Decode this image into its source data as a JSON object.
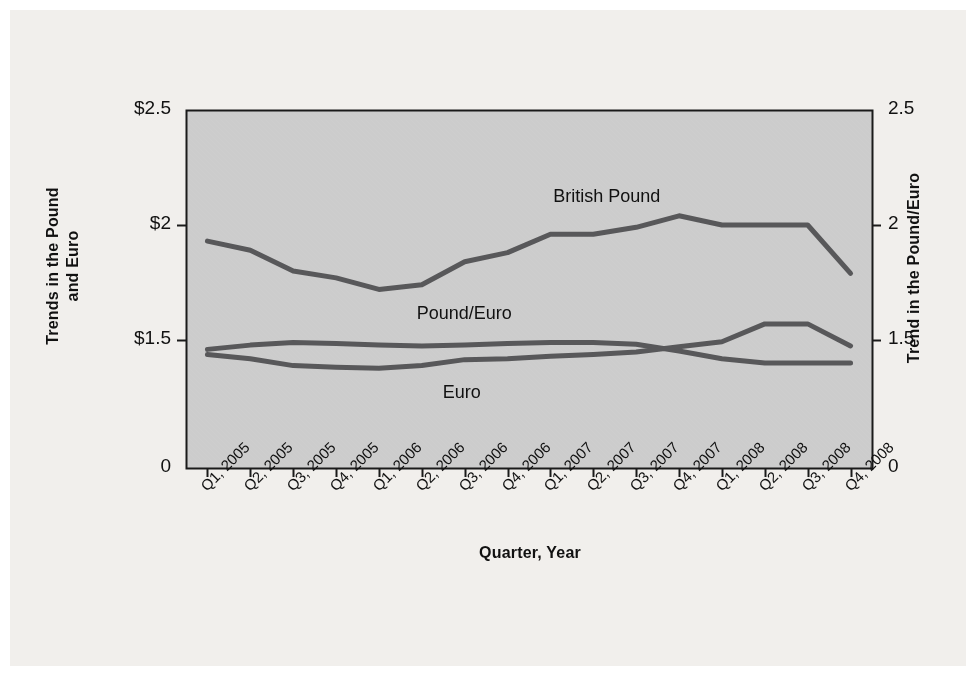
{
  "figure": {
    "background_color": "#f1efec",
    "plot_background_color": "#cccccc",
    "line_color": "#58585a",
    "axis_color": "#1a1a1a"
  },
  "chart_data": {
    "type": "line",
    "title": "",
    "xlabel": "Quarter, Year",
    "ylabel": "Trends in the Pound and Euro",
    "ylabel_right": "Trend in the Pound/Euro",
    "grid": false,
    "legend_position": "inline-labels",
    "categories": [
      "Q1, 2005",
      "Q2, 2005",
      "Q3, 2005",
      "Q4, 2005",
      "Q1, 2006",
      "Q2, 2006",
      "Q3, 2006",
      "Q4, 2006",
      "Q1, 2007",
      "Q2, 2007",
      "Q3, 2007",
      "Q4, 2007",
      "Q1, 2008",
      "Q2, 2008",
      "Q3, 2008",
      "Q4, 2008"
    ],
    "ylim": [
      0,
      2.5
    ],
    "yticks": [
      0,
      1.5,
      2,
      2.5
    ],
    "ytick_labels_left": [
      "0",
      "$1.5",
      "$2",
      "$2.5"
    ],
    "ytick_labels_right": [
      "0",
      "1.5",
      "2",
      "2.5"
    ],
    "axis_break_between": [
      0,
      1.5
    ],
    "series": [
      {
        "name": "British Pound",
        "values": [
          1.93,
          1.89,
          1.8,
          1.77,
          1.72,
          1.74,
          1.84,
          1.88,
          1.96,
          1.96,
          1.99,
          2.04,
          2.0,
          2.0,
          2.0,
          1.79
        ],
        "label_x_category": "Q2, 2007",
        "label_text": "British Pound"
      },
      {
        "name": "Pound/Euro",
        "values": [
          1.39,
          1.44,
          1.47,
          1.46,
          1.44,
          1.43,
          1.44,
          1.46,
          1.47,
          1.47,
          1.45,
          1.37,
          1.28,
          1.23,
          1.23,
          1.23
        ],
        "label_x_category": "Q3, 2006",
        "label_text": "Pound/Euro"
      },
      {
        "name": "Euro",
        "values": [
          1.33,
          1.28,
          1.2,
          1.18,
          1.17,
          1.2,
          1.27,
          1.28,
          1.31,
          1.33,
          1.36,
          1.42,
          1.48,
          1.57,
          1.57,
          1.43
        ],
        "label_x_category": "Q3, 2006",
        "label_text": "Euro"
      }
    ]
  },
  "axes": {
    "left_title": "Trends in the Pound\nand Euro",
    "left_title_line1": "Trends in the Pound",
    "left_title_line2": "and Euro",
    "right_title": "Trend in the Pound/Euro",
    "bottom_title": "Quarter, Year"
  },
  "series_labels": {
    "british_pound": "British Pound",
    "pound_euro": "Pound/Euro",
    "euro": "Euro"
  }
}
